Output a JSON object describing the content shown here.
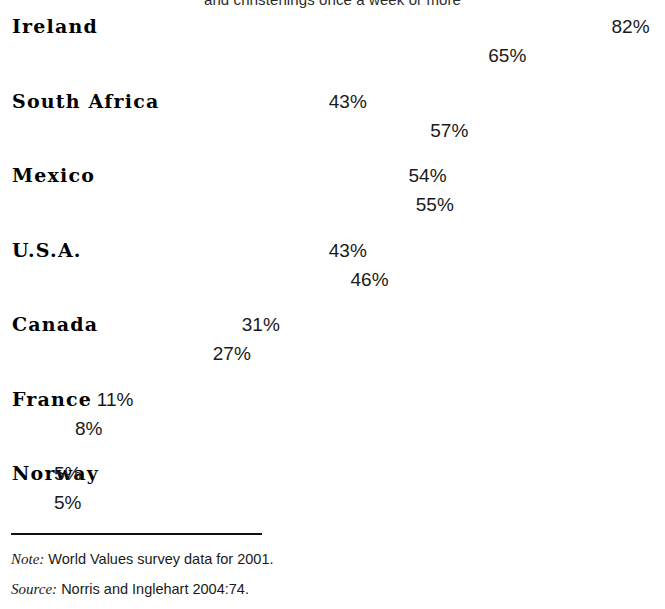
{
  "heading": "and christenings once a week or more",
  "chart_data": {
    "type": "bar",
    "orientation": "horizontal",
    "title": "and christenings once a week or more",
    "xlabel": "",
    "ylabel": "",
    "xlim": [
      0,
      90
    ],
    "grid": false,
    "legend_position": "inline-first-bar",
    "value_suffix": "%",
    "categories": [
      "Ireland",
      "South Africa",
      "Mexico",
      "U.S.A.",
      "Canada",
      "France",
      "Norway"
    ],
    "series": [
      {
        "name": "1981",
        "color": "#8d8d8d",
        "values": [
          82,
          43,
          54,
          43,
          31,
          11,
          5
        ]
      },
      {
        "name": "2001",
        "color": "#aaaaaa",
        "values": [
          65,
          57,
          55,
          46,
          27,
          8,
          5
        ]
      }
    ],
    "rows": [
      {
        "category": "Ireland",
        "v1981": 82,
        "v2001": 65,
        "label1981": "82%",
        "label2001": "65%",
        "tag1981": "1981",
        "tag2001": "2001",
        "showTags": true
      },
      {
        "category": "South Africa",
        "v1981": 43,
        "v2001": 57,
        "label1981": "43%",
        "label2001": "57%",
        "tag1981": "",
        "tag2001": "",
        "showTags": false
      },
      {
        "category": "Mexico",
        "v1981": 54,
        "v2001": 55,
        "label1981": "54%",
        "label2001": "55%",
        "tag1981": "",
        "tag2001": "",
        "showTags": false
      },
      {
        "category": "U.S.A.",
        "v1981": 43,
        "v2001": 46,
        "label1981": "43%",
        "label2001": "46%",
        "tag1981": "",
        "tag2001": "",
        "showTags": false
      },
      {
        "category": "Canada",
        "v1981": 31,
        "v2001": 27,
        "label1981": "31%",
        "label2001": "27%",
        "tag1981": "",
        "tag2001": "",
        "showTags": false
      },
      {
        "category": "France",
        "v1981": 11,
        "v2001": 8,
        "label1981": "11%",
        "label2001": "8%",
        "tag1981": "",
        "tag2001": "",
        "showTags": false
      },
      {
        "category": "Norway",
        "v1981": 5,
        "v2001": 5,
        "label1981": "5%",
        "label2001": "5%",
        "tag1981": "",
        "tag2001": "",
        "showTags": false
      }
    ]
  },
  "footer": {
    "note_lead": "Note:",
    "note_text": "World Values survey data for 2001.",
    "source_lead": "Source:",
    "source_text": "Norris and Inglehart 2004:74."
  },
  "layout": {
    "bar_origin_x": 11,
    "px_per_percent": 7.25,
    "group_top": 11,
    "group_step": 74.5,
    "min_bar_px": 37
  }
}
